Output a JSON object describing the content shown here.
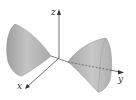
{
  "figure": {
    "type": "hyperboloid-of-two-sheets",
    "axis_of_symmetry": "y",
    "axes": {
      "x": {
        "label": "x"
      },
      "y": {
        "label": "y"
      },
      "z": {
        "label": "z"
      }
    },
    "colors": {
      "surface": "#b8b8b8",
      "surface_shadow": "#9a9a9a",
      "surface_highlight": "#d4d4d4",
      "axis": "#333333",
      "background": "#ffffff"
    }
  }
}
